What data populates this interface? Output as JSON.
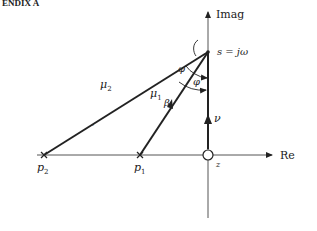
{
  "header": {
    "text": "ENDIX A"
  },
  "axes": {
    "imag_label": "Imag",
    "real_label": "Re"
  },
  "points": {
    "s_label": "s = jω",
    "p1_label": "p",
    "p1_sub": "1",
    "p2_label": "p",
    "p2_sub": "2",
    "z_label": "z"
  },
  "vectors": {
    "mu1_label": "μ",
    "mu1_sub": "1",
    "mu2_label": "μ",
    "mu2_sub": "2",
    "nu_label": "ν"
  },
  "angles": {
    "phi_upper": "φ",
    "phi_lower": "φ",
    "beta": "β"
  },
  "colors": {
    "ink": "#222222",
    "axis": "#555555",
    "background": "#ffffff"
  }
}
